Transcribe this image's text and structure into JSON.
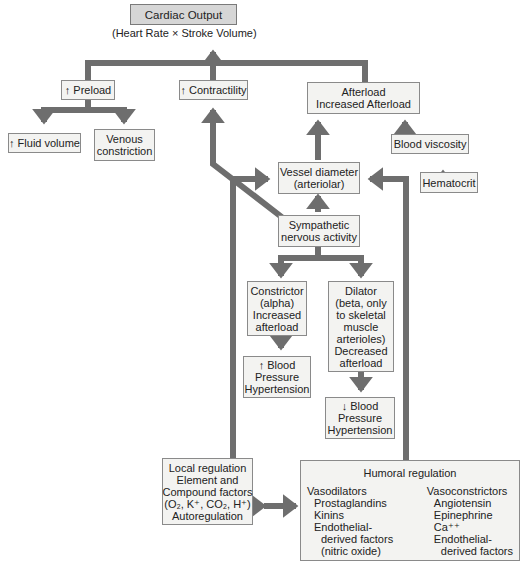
{
  "diagram": {
    "title": "Cardiac Output",
    "subtitle": "(Heart Rate × Stroke Volume)",
    "colors": {
      "arrow": "#6e6e6e",
      "box_fill": "#f3f3f1",
      "title_fill": "#d6d6d6",
      "border": "#8a8a8a"
    },
    "nodes": {
      "preload": [
        "↑ Preload"
      ],
      "contractility": [
        "↑ Contractility"
      ],
      "afterload": [
        "Afterload",
        "Increased Afterload"
      ],
      "fluid_volume": [
        "↑ Fluid volume"
      ],
      "venous_constriction": [
        "Venous",
        "constriction"
      ],
      "blood_viscosity": [
        "Blood viscosity"
      ],
      "hematocrit": [
        "Hematocrit"
      ],
      "vessel_diameter": [
        "Vessel diameter",
        "(arteriolar)"
      ],
      "sympathetic": [
        "Sympathetic",
        "nervous activity"
      ],
      "constrictor": [
        "Constrictor",
        "(alpha)",
        "Increased",
        "afterload"
      ],
      "dilator": [
        "Dilator",
        "(beta, only",
        "to skeletal",
        "muscle",
        "arterioles)",
        "Decreased",
        "afterload"
      ],
      "bp_up": [
        "↑ Blood",
        "Pressure",
        "Hypertension"
      ],
      "bp_down": [
        "↓ Blood",
        "Pressure",
        "Hypertension"
      ],
      "local_regulation": [
        "Local regulation",
        "Element and",
        "Compound factors",
        "(O₂, K⁺, CO₂, H⁺)",
        "Autoregulation"
      ],
      "humoral": {
        "title": "Humoral regulation",
        "vasodilators": {
          "heading": "Vasodilators",
          "items": [
            "Prostaglandins",
            "Kinins",
            "Endothelial-"
          ],
          "cont": [
            "derived factors",
            "(nitric oxide)"
          ]
        },
        "vasoconstrictors": {
          "heading": "Vasoconstrictors",
          "items": [
            "Angiotensin",
            "Epinephrine",
            "Ca⁺⁺",
            "Endothelial-"
          ],
          "cont": [
            "derived factors"
          ]
        }
      }
    }
  }
}
